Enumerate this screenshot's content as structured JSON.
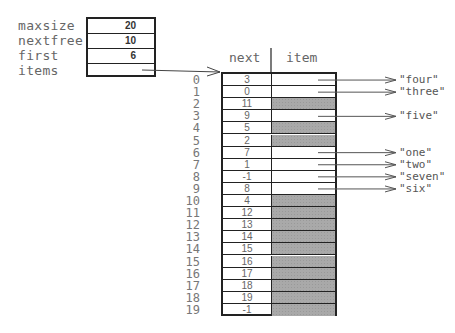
{
  "struct": {
    "fields": [
      {
        "label": "maxsize",
        "value": "20"
      },
      {
        "label": "nextfree",
        "value": "10"
      },
      {
        "label": "first",
        "value": "6"
      },
      {
        "label": "items",
        "value": ""
      }
    ]
  },
  "table": {
    "headers": {
      "next": "next",
      "item": "item"
    },
    "rows": [
      {
        "index": "0",
        "next": "3",
        "item": "\"four\"",
        "free": false
      },
      {
        "index": "1",
        "next": "0",
        "item": "\"three\"",
        "free": false
      },
      {
        "index": "2",
        "next": "11",
        "item": "",
        "free": true
      },
      {
        "index": "3",
        "next": "9",
        "item": "\"five\"",
        "free": false
      },
      {
        "index": "4",
        "next": "5",
        "item": "",
        "free": true
      },
      {
        "index": "5",
        "next": "2",
        "item": "",
        "free": true
      },
      {
        "index": "6",
        "next": "7",
        "item": "\"one\"",
        "free": false
      },
      {
        "index": "7",
        "next": "1",
        "item": "\"two\"",
        "free": false
      },
      {
        "index": "8",
        "next": "-1",
        "item": "\"seven\"",
        "free": false
      },
      {
        "index": "9",
        "next": "8",
        "item": "\"six\"",
        "free": false
      },
      {
        "index": "10",
        "next": "4",
        "item": "",
        "free": true
      },
      {
        "index": "11",
        "next": "12",
        "item": "",
        "free": true
      },
      {
        "index": "12",
        "next": "13",
        "item": "",
        "free": true
      },
      {
        "index": "13",
        "next": "14",
        "item": "",
        "free": true
      },
      {
        "index": "14",
        "next": "15",
        "item": "",
        "free": true
      },
      {
        "index": "15",
        "next": "16",
        "item": "",
        "free": true
      },
      {
        "index": "16",
        "next": "17",
        "item": "",
        "free": true
      },
      {
        "index": "17",
        "next": "18",
        "item": "",
        "free": true
      },
      {
        "index": "18",
        "next": "19",
        "item": "",
        "free": true
      },
      {
        "index": "19",
        "next": "-1",
        "item": "",
        "free": true
      }
    ]
  },
  "colors": {
    "border": "#222222",
    "free_cell": "#a9a9a9",
    "text": "#666666"
  }
}
